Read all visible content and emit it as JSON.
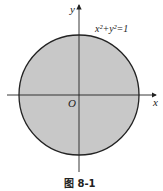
{
  "figure": {
    "caption": "图 8-1",
    "equation_label": "x²+y²=1",
    "x_axis_label": "x",
    "y_axis_label": "y",
    "origin_label": "O",
    "circle": {
      "center": [
        0,
        0
      ],
      "radius": 1,
      "fill": "#c8c8c8",
      "stroke": "#222222"
    },
    "colors": {
      "axis": "#222222",
      "background": "#ffffff"
    }
  }
}
